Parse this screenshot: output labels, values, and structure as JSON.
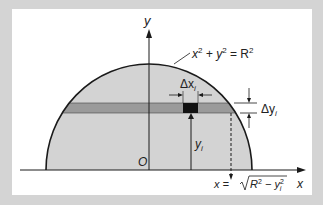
{
  "figure": {
    "labels": {
      "y_axis": "y",
      "x_axis": "x",
      "origin": "O",
      "curve_eq_base": "x",
      "curve_eq_mid": " + y",
      "curve_eq_end": " = R",
      "sup2": "2",
      "dx_delta": "Δx",
      "dx_sub": "i",
      "dy_delta": "Δy",
      "dy_sub": "i",
      "yi": "y",
      "yi_sub": "i",
      "xeq_left": "x = ",
      "xeq_R": "R",
      "xeq_minus": " − y",
      "xeq_sub": "i"
    },
    "colors": {
      "border": "#d4d4d4",
      "region_fill": "#d3d3d3",
      "strip_fill": "#9a9a9a",
      "element_fill": "#111111",
      "stroke": "#1a1a1a"
    }
  }
}
